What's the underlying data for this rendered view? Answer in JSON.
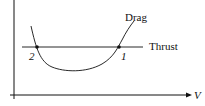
{
  "diagram": {
    "type": "thrust-drag-curve",
    "labels": {
      "drag": "Drag",
      "thrust": "Thrust",
      "x_axis": "V",
      "point_1": "1",
      "point_2": "2"
    },
    "colors": {
      "line": "#111111",
      "background": "#ffffff"
    }
  }
}
